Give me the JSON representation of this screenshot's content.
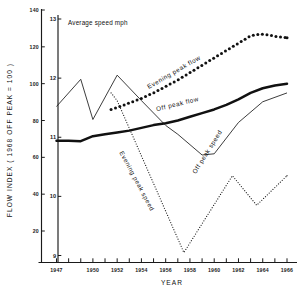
{
  "chart_data": {
    "type": "line",
    "title": "",
    "xlabel": "YEAR",
    "ylabel": "FLOW INDEX ( 1968 OFF PEAK = 100 )",
    "ylabel_secondary": "Average speed mph",
    "xlim": [
      1946.2,
      1966.6
    ],
    "ylim": [
      0,
      140
    ],
    "ylim_secondary": [
      8.8,
      13.2
    ],
    "grid": false,
    "legend": "inline-annotations",
    "xticks": [
      1947,
      1948,
      1949,
      1950,
      1951,
      1952,
      1953,
      1954,
      1955,
      1956,
      1957,
      1958,
      1959,
      1960,
      1961,
      1962,
      1963,
      1964,
      1965,
      1966
    ],
    "xticklabels": [
      "1947",
      "1950",
      "1952",
      "1954",
      "1956",
      "1958",
      "1960",
      "1962",
      "1964",
      "1966"
    ],
    "xticklabel_years": [
      1947,
      1950,
      1952,
      1954,
      1956,
      1958,
      1960,
      1962,
      1964,
      1966
    ],
    "yticks": [
      20,
      40,
      60,
      80,
      100,
      120,
      140
    ],
    "yticklabels": [
      "20",
      "40",
      "60",
      "80",
      "100",
      "120",
      "140"
    ],
    "yticks_secondary": [
      9,
      10,
      11,
      12,
      13
    ],
    "yticklabels_secondary": [
      "9",
      "10",
      "11",
      "12",
      "13"
    ],
    "series": [
      {
        "name": "Evening peak flow",
        "axis": "flow",
        "style": "heavy-dotted",
        "x": [
          1951.5,
          1952,
          1953,
          1954,
          1955,
          1956,
          1957,
          1958,
          1959,
          1960,
          1961,
          1962,
          1963,
          1963.8,
          1964.5,
          1965.2,
          1966
        ],
        "values": [
          86,
          87,
          89.5,
          92,
          95,
          98.5,
          102,
          106,
          110,
          114,
          118,
          122,
          126,
          127,
          126.5,
          125.5,
          125
        ]
      },
      {
        "name": "Off peak flow",
        "axis": "flow",
        "style": "bold-solid",
        "x": [
          1947,
          1948,
          1949,
          1950,
          1951,
          1952,
          1953,
          1954,
          1955,
          1956,
          1957,
          1958,
          1959,
          1960,
          1961,
          1962,
          1963,
          1964,
          1965,
          1966
        ],
        "values": [
          69,
          69,
          68.8,
          71.5,
          72.5,
          73.5,
          74.5,
          76,
          77.5,
          78.5,
          80,
          82,
          84,
          86,
          88.5,
          91.5,
          95,
          97.5,
          99,
          100
        ]
      },
      {
        "name": "Off peak speed",
        "axis": "speed",
        "style": "thin-solid",
        "x": [
          1947,
          1949,
          1950,
          1952,
          1954,
          1956,
          1957,
          1959,
          1960,
          1962,
          1964,
          1966
        ],
        "values": [
          11.52,
          11.98,
          11.3,
          12.05,
          11.62,
          11.2,
          11.05,
          10.7,
          10.72,
          11.25,
          11.6,
          11.75
        ]
      },
      {
        "name": "Evening peak speed",
        "axis": "speed",
        "style": "fine-dotted",
        "x": [
          1951.5,
          1952,
          1957.5,
          1961.5,
          1963.5,
          1966
        ],
        "values": [
          11.75,
          11.62,
          9.05,
          10.35,
          9.85,
          10.35
        ]
      }
    ],
    "annotations": [
      {
        "text": "Average speed mph",
        "kind": "axis-caption"
      },
      {
        "text": "Evening peak flow",
        "kind": "series-label"
      },
      {
        "text": "Off peak flow",
        "kind": "series-label"
      },
      {
        "text": "Off peak speed",
        "kind": "series-label"
      },
      {
        "text": "Evening peak speed",
        "kind": "series-label"
      }
    ]
  }
}
